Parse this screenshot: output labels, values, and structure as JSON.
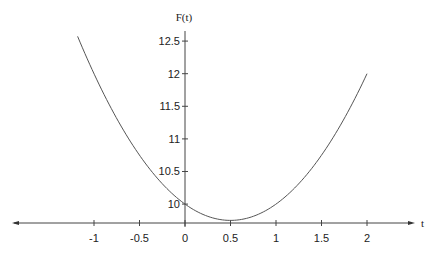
{
  "chart_data": {
    "type": "line",
    "title": "",
    "xlabel": "t",
    "ylabel": "F(t)",
    "function": "F(t) = t^2 - t + 10",
    "xlim": [
      -1.9,
      2.5
    ],
    "ylim": [
      9.71,
      12.72
    ],
    "x_axis_crosses_at_y": 9.71,
    "x_ticks": [
      -1,
      -0.5,
      0,
      0.5,
      1,
      1.5,
      2
    ],
    "x_tick_labels": [
      "-1",
      "-0.5",
      "0",
      "0.5",
      "1",
      "1.5",
      "2"
    ],
    "y_ticks": [
      10,
      10.5,
      11,
      11.5,
      12,
      12.5
    ],
    "y_tick_labels": [
      "10",
      "10.5",
      "11",
      "11.5",
      "12",
      "12.5"
    ],
    "grid": false,
    "legend": null,
    "series": [
      {
        "name": "F(t)",
        "color": "#555555",
        "x": [
          -1.18,
          -1.0,
          -0.75,
          -0.5,
          -0.25,
          0,
          0.25,
          0.5,
          0.75,
          1.0,
          1.25,
          1.5,
          1.75,
          2.0
        ],
        "y": [
          12.57,
          12.0,
          11.31,
          10.75,
          10.31,
          10.0,
          9.81,
          9.75,
          9.81,
          10.0,
          10.31,
          10.75,
          11.31,
          12.0
        ]
      }
    ],
    "t_range": [
      -1.18,
      2.0
    ],
    "minimum": {
      "t": 0.5,
      "F": 9.75
    }
  },
  "layout": {
    "origin_px": {
      "x": 185,
      "y": 223
    },
    "px_per_t": 91,
    "px_per_F": 65.2,
    "F_at_x_axis": 9.71
  },
  "labels": {
    "y_axis_title": "F(t)",
    "x_axis_title": "t"
  }
}
